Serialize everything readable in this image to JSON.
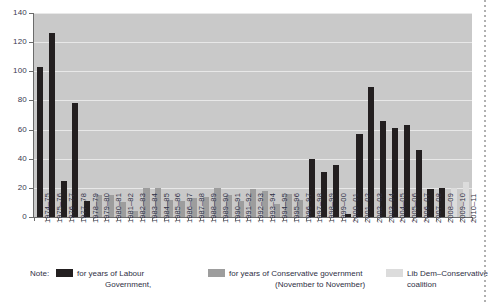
{
  "chart_data": {
    "type": "bar",
    "title": "",
    "xlabel": "",
    "ylabel": "",
    "ylim": [
      0,
      140
    ],
    "yticks": [
      0,
      20,
      40,
      60,
      80,
      100,
      120,
      140
    ],
    "grid": true,
    "legend_position": "bottom",
    "categories": [
      "1974–75",
      "1975–76",
      "1976–77",
      "1977–78",
      "1978–79",
      "1979–80",
      "1980–81",
      "1981–82",
      "1982–83",
      "1983–84",
      "1984–85",
      "1985–86",
      "1986–87",
      "1987–88",
      "1988–89",
      "1989–90",
      "1990–91",
      "1991–92",
      "1992–93",
      "1993–94",
      "1994–95",
      "1995–96",
      "1996–97",
      "1997–98",
      "1998–99",
      "1999–00",
      "2000–01",
      "2001–02",
      "2002–03",
      "2003–04",
      "2004–05",
      "2005–06",
      "2006–07",
      "2007–08",
      "2008–09",
      "2009–10",
      "2010–11"
    ],
    "values": [
      103,
      126,
      25,
      78,
      11,
      15,
      15,
      10,
      4,
      20,
      20,
      12,
      11,
      13,
      14,
      20,
      15,
      11,
      19,
      18,
      9,
      16,
      12,
      40,
      31,
      36,
      2,
      57,
      89,
      66,
      61,
      63,
      46,
      19,
      20,
      20,
      24
    ],
    "bar_groups": [
      "labour",
      "labour",
      "labour",
      "labour",
      "labour",
      "conservative",
      "conservative",
      "conservative",
      "conservative",
      "conservative",
      "conservative",
      "conservative",
      "conservative",
      "conservative",
      "conservative",
      "conservative",
      "conservative",
      "conservative",
      "conservative",
      "conservative",
      "conservative",
      "conservative",
      "conservative",
      "labour",
      "labour",
      "labour",
      "labour",
      "labour",
      "labour",
      "labour",
      "labour",
      "labour",
      "labour",
      "labour",
      "labour",
      "coalition",
      "coalition"
    ],
    "colors": {
      "labour": "#231f20",
      "conservative": "#9d9d9d",
      "coalition": "#dcdcdc",
      "plot_background": "#c9c9c9",
      "gridline": "#e8e8e8",
      "axis": "#6b6b6b",
      "text": "#2f2f45"
    }
  },
  "note": {
    "word": "Note:",
    "legend": [
      {
        "key": "labour",
        "line1": "for years of Labour",
        "line2": "Government,"
      },
      {
        "key": "conservative",
        "line1": "for years of Conservative government",
        "line2": "(November to November)"
      },
      {
        "key": "coalition",
        "line1": "Lib Dem–Conservative",
        "line2": "coalition"
      }
    ]
  }
}
